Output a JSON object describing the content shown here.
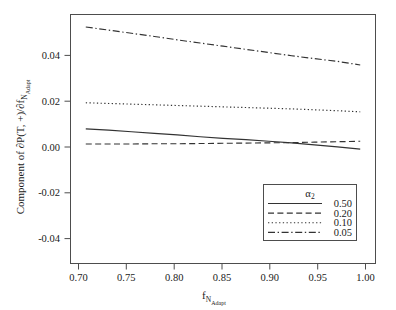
{
  "chart_data": {
    "type": "line",
    "title": "",
    "subtitle": "",
    "xlabel": "f_N_Adapt",
    "xlabel_base": "f",
    "xlabel_sub": "N",
    "xlabel_subsub": "Adapt",
    "ylabel": "Component of ∂P(T, +)/∂f_N_Adapt",
    "ylabel_part1": "Component of ∂P(T, +)/∂f",
    "ylabel_sub": "N",
    "ylabel_subsub": "Adapt",
    "xlim": [
      0.6833,
      1.0167
    ],
    "ylim": [
      -0.0555,
      0.0545
    ],
    "xticks": [
      0.7,
      0.75,
      0.8,
      0.85,
      0.9,
      0.95,
      1.0
    ],
    "xtick_labels": [
      "0.70",
      "0.75",
      "0.80",
      "0.85",
      "0.90",
      "0.95",
      "1.00"
    ],
    "yticks": [
      0.04,
      0.02,
      0.0,
      -0.02,
      -0.04
    ],
    "ytick_labels": [
      "0.04",
      "0.02",
      "0.00",
      "-0.02",
      "-0.04"
    ],
    "grid": false,
    "legend_position": "bottom-right",
    "legend_title": "α",
    "legend_title_sub": "2",
    "x": [
      0.7,
      0.725,
      0.75,
      0.775,
      0.8,
      0.825,
      0.85,
      0.875,
      0.9,
      0.925,
      0.95,
      0.975,
      1.0
    ],
    "series": [
      {
        "name": "0.50",
        "style": "solid",
        "color": "#333333",
        "values": [
          0.004,
          0.0034,
          0.0027,
          0.002,
          0.0013,
          0.0005,
          -0.0002,
          -0.0008,
          -0.0015,
          -0.0022,
          -0.0031,
          -0.004,
          -0.005
        ]
      },
      {
        "name": "0.20",
        "style": "dashed",
        "color": "#333333",
        "values": [
          -0.0027,
          -0.0027,
          -0.0027,
          -0.0026,
          -0.0026,
          -0.0025,
          -0.0024,
          -0.0023,
          -0.0022,
          -0.0021,
          -0.0019,
          -0.0017,
          -0.0015
        ]
      },
      {
        "name": "0.10",
        "style": "dotted",
        "color": "#333333",
        "values": [
          0.0155,
          0.0152,
          0.0149,
          0.0146,
          0.0143,
          0.014,
          0.0137,
          0.0134,
          0.0131,
          0.0128,
          0.0124,
          0.012,
          0.0115
        ]
      },
      {
        "name": "0.05",
        "style": "dashdot",
        "color": "#333333",
        "values": [
          0.049,
          0.0476,
          0.0462,
          0.0448,
          0.0433,
          0.0419,
          0.0405,
          0.0391,
          0.0377,
          0.0363,
          0.035,
          0.0338,
          0.0322
        ]
      }
    ]
  },
  "figure": {
    "background": "#ffffff",
    "axis_color": "#4d4d4d",
    "text_color": "#1a1a1a"
  }
}
